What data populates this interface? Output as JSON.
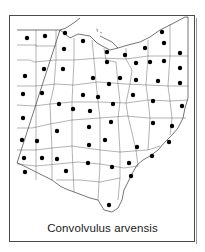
{
  "figure": {
    "caption": "Convolvulus arvensis",
    "region": "Ohio county distribution map",
    "colors": {
      "outline": "#3a3a3a",
      "dot": "#000000",
      "background": "#ffffff",
      "frame": "#4a4a4a"
    }
  },
  "dots": [
    [
      27,
      38
    ],
    [
      45,
      36
    ],
    [
      65,
      33
    ],
    [
      83,
      41
    ],
    [
      64,
      49
    ],
    [
      107,
      52
    ],
    [
      125,
      55
    ],
    [
      145,
      48
    ],
    [
      162,
      32
    ],
    [
      164,
      43
    ],
    [
      180,
      53
    ],
    [
      107,
      62
    ],
    [
      136,
      63
    ],
    [
      150,
      62
    ],
    [
      164,
      61
    ],
    [
      180,
      68
    ],
    [
      25,
      76
    ],
    [
      44,
      69
    ],
    [
      63,
      69
    ],
    [
      93,
      78
    ],
    [
      109,
      84
    ],
    [
      120,
      78
    ],
    [
      136,
      80
    ],
    [
      158,
      81
    ],
    [
      180,
      83
    ],
    [
      23,
      94
    ],
    [
      42,
      93
    ],
    [
      83,
      95
    ],
    [
      98,
      97
    ],
    [
      133,
      95
    ],
    [
      153,
      101
    ],
    [
      182,
      106
    ],
    [
      59,
      104
    ],
    [
      73,
      109
    ],
    [
      90,
      111
    ],
    [
      113,
      104
    ],
    [
      23,
      118
    ],
    [
      57,
      131
    ],
    [
      89,
      127
    ],
    [
      111,
      122
    ],
    [
      153,
      123
    ],
    [
      172,
      126
    ],
    [
      22,
      140
    ],
    [
      37,
      141
    ],
    [
      89,
      145
    ],
    [
      105,
      140
    ],
    [
      137,
      147
    ],
    [
      169,
      142
    ],
    [
      24,
      158
    ],
    [
      42,
      158
    ],
    [
      57,
      159
    ],
    [
      88,
      163
    ],
    [
      129,
      163
    ],
    [
      152,
      156
    ],
    [
      25,
      172
    ],
    [
      66,
      171
    ],
    [
      112,
      167
    ],
    [
      131,
      176
    ],
    [
      109,
      205
    ]
  ]
}
